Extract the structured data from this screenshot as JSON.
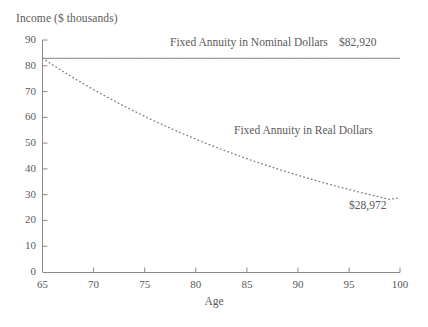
{
  "chart_data": {
    "type": "line",
    "title": "",
    "xlabel": "Age",
    "ylabel": "Income ($ thousands)",
    "xlim": [
      65,
      100
    ],
    "ylim": [
      0,
      90
    ],
    "xticks": [
      65,
      70,
      75,
      80,
      85,
      90,
      95,
      100
    ],
    "yticks": [
      0,
      10,
      20,
      30,
      40,
      50,
      60,
      70,
      80,
      90
    ],
    "grid": false,
    "legend_position": "inline-annotations",
    "x": [
      65,
      66,
      67,
      68,
      69,
      70,
      71,
      72,
      73,
      74,
      75,
      76,
      77,
      78,
      79,
      80,
      81,
      82,
      83,
      84,
      85,
      86,
      87,
      88,
      89,
      90,
      91,
      92,
      93,
      94,
      95,
      96,
      97,
      98,
      99,
      100
    ],
    "series": [
      {
        "name": "Fixed Annuity in Nominal Dollars",
        "style": "solid",
        "color": "#808080",
        "end_value_label": "$82,920",
        "values": [
          82.92,
          82.92,
          82.92,
          82.92,
          82.92,
          82.92,
          82.92,
          82.92,
          82.92,
          82.92,
          82.92,
          82.92,
          82.92,
          82.92,
          82.92,
          82.92,
          82.92,
          82.92,
          82.92,
          82.92,
          82.92,
          82.92,
          82.92,
          82.92,
          82.92,
          82.92,
          82.92,
          82.92,
          82.92,
          82.92,
          82.92,
          82.92,
          82.92,
          82.92,
          82.92,
          82.92
        ]
      },
      {
        "name": "Fixed Annuity in Real Dollars",
        "style": "dotted",
        "color": "#808080",
        "end_value_label": "$28,972",
        "values": [
          82.92,
          80.34,
          77.84,
          75.42,
          73.08,
          70.81,
          68.61,
          66.48,
          64.41,
          62.41,
          60.47,
          58.59,
          56.77,
          55.0,
          53.29,
          51.63,
          50.03,
          48.47,
          46.96,
          45.5,
          44.09,
          42.72,
          41.39,
          40.1,
          38.85,
          37.64,
          36.47,
          35.34,
          34.24,
          33.17,
          32.14,
          31.14,
          30.17,
          29.24,
          28.33,
          28.97
        ]
      }
    ],
    "annotations": [
      {
        "id": "nominal-series-label",
        "text": "Fixed Annuity in Nominal Dollars"
      },
      {
        "id": "nominal-value-label",
        "text": "$82,920"
      },
      {
        "id": "real-series-label",
        "text": "Fixed Annuity in Real Dollars"
      },
      {
        "id": "real-value-label",
        "text": "$28,972"
      }
    ],
    "axis_color": "#888888",
    "text_color": "#5a5a5a"
  },
  "ytick_labels": [
    "90",
    "80",
    "70",
    "60",
    "50",
    "40",
    "30",
    "20",
    "10",
    "0"
  ],
  "xtick_labels": [
    "65",
    "70",
    "75",
    "80",
    "85",
    "90",
    "95",
    "100"
  ]
}
